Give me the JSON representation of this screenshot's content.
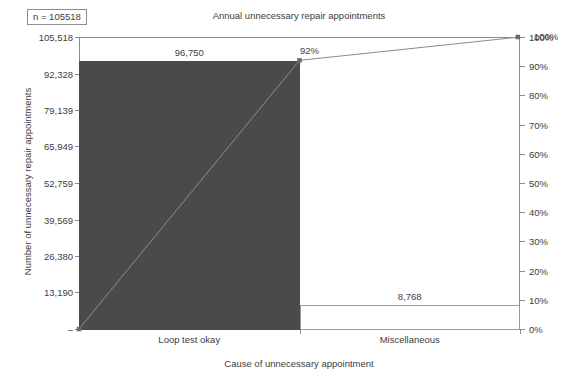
{
  "badge": {
    "label": "n = 105518"
  },
  "chart_data": {
    "type": "bar",
    "title": "Annual unnecessary repair appointments",
    "xlabel": "Cause of unnecessary appointment",
    "ylabel": "Number of unnecessary repair appointments",
    "ylabel_right": "",
    "categories": [
      "Loop test okay",
      "Miscellaneous"
    ],
    "values": [
      96750,
      8768
    ],
    "value_labels": [
      "96,750",
      "8,768"
    ],
    "cumulative_percent": [
      92,
      100
    ],
    "cumulative_labels": [
      "92%",
      "100%"
    ],
    "total": 105518,
    "ylim": [
      0,
      105518
    ],
    "ylim_right": [
      0,
      100
    ],
    "grid": false,
    "legend": "none",
    "yticks": [
      0,
      13190,
      26380,
      39569,
      52759,
      65949,
      79139,
      92328,
      105518
    ],
    "ytick_labels": [
      "–",
      "13,190",
      "26,380",
      "39,569",
      "52,759",
      "65,949",
      "79,139",
      "92,328",
      "105,518"
    ],
    "yticks_right": [
      0,
      10,
      20,
      30,
      40,
      50,
      60,
      70,
      80,
      90,
      100
    ],
    "ytick_labels_right": [
      "0%",
      "10%",
      "20%",
      "30%",
      "40%",
      "50%",
      "60%",
      "70%",
      "80%",
      "90%",
      "100%"
    ],
    "bar_fill_colors": [
      "#4a4a4a",
      "#ffffff"
    ],
    "bar_edge_colors": [
      "#4a4a4a",
      "#9a9a9a"
    ],
    "line_color": "#8c8c8c",
    "marker_color": "#6b6b6b",
    "axis_color": "#8c8c8c",
    "text_color": "#3d3d3d",
    "background": "#ffffff"
  }
}
